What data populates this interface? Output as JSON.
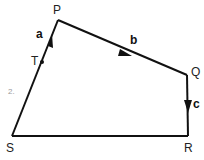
{
  "diagram": {
    "vertices": {
      "P": {
        "label": "P",
        "x": 58,
        "y": 20
      },
      "Q": {
        "label": "Q",
        "x": 187,
        "y": 75
      },
      "R": {
        "label": "R",
        "x": 188,
        "y": 136
      },
      "S": {
        "label": "S",
        "x": 12,
        "y": 136
      },
      "T": {
        "label": "T",
        "x": 42,
        "y": 62
      }
    },
    "vectors": {
      "a": {
        "label": "a",
        "from": "S",
        "to": "P"
      },
      "b": {
        "label": "b",
        "from": "P",
        "to": "Q"
      },
      "c": {
        "label": "c",
        "from": "Q",
        "to": "R"
      }
    },
    "annotation": "2.",
    "colors": {
      "line": "#111111",
      "background": "#ffffff",
      "pencil": "#9a9a9a"
    }
  }
}
